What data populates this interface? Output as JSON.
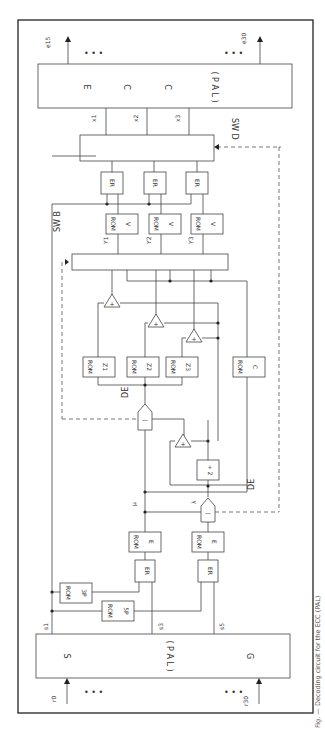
{
  "diagram": {
    "orientation": "rotated 90 degrees clockwise",
    "top_block": {
      "label": "E C C ( P A L )"
    },
    "bottom_block": {
      "labels": {
        "s": "S",
        "mid": "( P A L )",
        "g": "G"
      }
    },
    "outputs": {
      "first": "e",
      "first_sub": "15",
      "last": "e",
      "last_sub": "30",
      "ellipsis": "• • •"
    },
    "inputs": {
      "first": "r",
      "first_sub": "0",
      "last": "r",
      "last_sub": "30",
      "ellipsis": "• • •"
    },
    "syndromes": {
      "s1": "s",
      "s1_sub": "1",
      "s3": "s",
      "s3_sub": "3",
      "s5": "s",
      "s5_sub": "5"
    },
    "switches": {
      "swd": "SW D",
      "swb": "SW B"
    },
    "x_labels": [
      {
        "l": "x",
        "s": "1"
      },
      {
        "l": "x",
        "s": "2"
      },
      {
        "l": "x",
        "s": "3"
      }
    ],
    "y_labels": [
      {
        "l": "Y",
        "s": "1"
      },
      {
        "l": "Y",
        "s": "2"
      },
      {
        "l": "Y",
        "s": "3"
      }
    ],
    "er_label": "ER",
    "rom_label": "ROM",
    "rom_v": "V",
    "rom_z": [
      {
        "l": "Z",
        "s": "1"
      },
      {
        "l": "Z",
        "s": "2"
      },
      {
        "l": "Z",
        "s": "3"
      }
    ],
    "rom_c": "C",
    "rom_e": "E",
    "rom_3p": "3P",
    "rom_5p": "5P",
    "adder": "+",
    "subtractor": "—",
    "divider": "÷ 2",
    "de": "DE",
    "mu": "μ",
    "lambda": "λ"
  },
  "caption": "Fig. — Decoding circuit for the ECC (PAL)"
}
